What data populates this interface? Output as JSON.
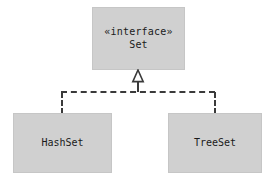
{
  "diagram": {
    "type": "uml-class-diagram",
    "relationship": "realization",
    "background_color": "#ffffff",
    "box_fill_color": "#d0d0d0",
    "box_border_color": "#c6c6c6",
    "line_color": "#3a3a3a",
    "text_color": "#1a1a1a",
    "nodes": [
      {
        "id": "set",
        "stereotype": "«interface»",
        "name": "Set",
        "kind": "interface"
      },
      {
        "id": "hashset",
        "name": "HashSet",
        "kind": "class"
      },
      {
        "id": "treeset",
        "name": "TreeSet",
        "kind": "class"
      }
    ],
    "edges": [
      {
        "from": "hashset",
        "to": "set",
        "style": "dashed",
        "arrow": "hollow-triangle"
      },
      {
        "from": "treeset",
        "to": "set",
        "style": "dashed",
        "arrow": "hollow-triangle"
      }
    ]
  }
}
